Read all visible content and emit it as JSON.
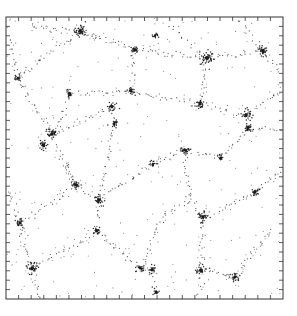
{
  "chart_data": {
    "type": "scatter",
    "title": "",
    "xlabel": "",
    "ylabel": "",
    "description": "Square framed scatter plot of particle positions showing a cellular web: dense clusters at nodes linked by dotted filaments, sparse uniform background points.",
    "grid": false,
    "legend": null,
    "frame": {
      "left": 6,
      "top": 17,
      "right": 283,
      "bottom": 299
    },
    "ticks": {
      "direction": "inward",
      "x_count": 22,
      "y_count": 30,
      "length": 4,
      "labels": []
    },
    "colors": {
      "points": "#1a1a1a",
      "frame": "#333333",
      "background": "#ffffff"
    },
    "clusters": [
      {
        "x": 80,
        "y": 31,
        "r": 5,
        "n": 40
      },
      {
        "x": 155,
        "y": 36,
        "r": 3,
        "n": 14
      },
      {
        "x": 135,
        "y": 50,
        "r": 4,
        "n": 22
      },
      {
        "x": 207,
        "y": 58,
        "r": 6,
        "n": 40
      },
      {
        "x": 263,
        "y": 51,
        "r": 5,
        "n": 32
      },
      {
        "x": 18,
        "y": 78,
        "r": 3,
        "n": 14
      },
      {
        "x": 131,
        "y": 91,
        "r": 4,
        "n": 20
      },
      {
        "x": 200,
        "y": 104,
        "r": 4,
        "n": 28
      },
      {
        "x": 70,
        "y": 94,
        "r": 4,
        "n": 20
      },
      {
        "x": 112,
        "y": 107,
        "r": 4,
        "n": 24
      },
      {
        "x": 246,
        "y": 115,
        "r": 5,
        "n": 28
      },
      {
        "x": 248,
        "y": 128,
        "r": 4,
        "n": 24
      },
      {
        "x": 52,
        "y": 134,
        "r": 5,
        "n": 32
      },
      {
        "x": 43,
        "y": 145,
        "r": 4,
        "n": 28
      },
      {
        "x": 114,
        "y": 124,
        "r": 4,
        "n": 18
      },
      {
        "x": 185,
        "y": 150,
        "r": 4,
        "n": 26
      },
      {
        "x": 221,
        "y": 158,
        "r": 3,
        "n": 14
      },
      {
        "x": 255,
        "y": 192,
        "r": 4,
        "n": 24
      },
      {
        "x": 76,
        "y": 185,
        "r": 4,
        "n": 22
      },
      {
        "x": 99,
        "y": 200,
        "r": 5,
        "n": 26
      },
      {
        "x": 20,
        "y": 223,
        "r": 4,
        "n": 24
      },
      {
        "x": 97,
        "y": 231,
        "r": 4,
        "n": 22
      },
      {
        "x": 153,
        "y": 164,
        "r": 3,
        "n": 12
      },
      {
        "x": 203,
        "y": 217,
        "r": 5,
        "n": 28
      },
      {
        "x": 32,
        "y": 268,
        "r": 5,
        "n": 34
      },
      {
        "x": 140,
        "y": 268,
        "r": 4,
        "n": 20
      },
      {
        "x": 152,
        "y": 270,
        "r": 4,
        "n": 20
      },
      {
        "x": 201,
        "y": 270,
        "r": 5,
        "n": 26
      },
      {
        "x": 235,
        "y": 277,
        "r": 4,
        "n": 22
      },
      {
        "x": 154,
        "y": 7,
        "r": 0,
        "n": 0
      },
      {
        "x": 156,
        "y": 292,
        "r": 3,
        "n": 14
      }
    ],
    "filaments": [
      [
        80,
        31,
        135,
        50
      ],
      [
        135,
        50,
        207,
        58
      ],
      [
        207,
        58,
        263,
        51
      ],
      [
        30,
        28,
        80,
        31
      ],
      [
        80,
        31,
        100,
        35
      ],
      [
        170,
        25,
        207,
        58
      ],
      [
        240,
        22,
        263,
        51
      ],
      [
        10,
        40,
        18,
        78
      ],
      [
        18,
        78,
        40,
        60
      ],
      [
        40,
        60,
        80,
        31
      ],
      [
        18,
        78,
        52,
        134
      ],
      [
        52,
        134,
        70,
        94
      ],
      [
        70,
        94,
        131,
        91
      ],
      [
        131,
        91,
        200,
        104
      ],
      [
        200,
        104,
        246,
        115
      ],
      [
        246,
        115,
        283,
        90
      ],
      [
        135,
        50,
        131,
        91
      ],
      [
        207,
        58,
        200,
        104
      ],
      [
        263,
        51,
        280,
        70
      ],
      [
        112,
        107,
        52,
        134
      ],
      [
        112,
        107,
        114,
        124
      ],
      [
        114,
        124,
        99,
        200
      ],
      [
        52,
        134,
        76,
        185
      ],
      [
        76,
        185,
        99,
        200
      ],
      [
        99,
        200,
        97,
        231
      ],
      [
        99,
        200,
        153,
        164
      ],
      [
        153,
        164,
        185,
        150
      ],
      [
        185,
        150,
        221,
        158
      ],
      [
        221,
        158,
        248,
        128
      ],
      [
        248,
        128,
        283,
        130
      ],
      [
        185,
        150,
        190,
        198
      ],
      [
        190,
        198,
        203,
        217
      ],
      [
        203,
        217,
        255,
        192
      ],
      [
        255,
        192,
        283,
        170
      ],
      [
        203,
        217,
        201,
        270
      ],
      [
        190,
        198,
        165,
        215
      ],
      [
        165,
        215,
        140,
        268
      ],
      [
        97,
        231,
        32,
        268
      ],
      [
        20,
        223,
        32,
        268
      ],
      [
        20,
        223,
        10,
        190
      ],
      [
        32,
        268,
        40,
        299
      ],
      [
        140,
        268,
        152,
        270
      ],
      [
        152,
        270,
        156,
        292
      ],
      [
        201,
        270,
        235,
        277
      ],
      [
        235,
        277,
        255,
        250
      ],
      [
        255,
        250,
        270,
        230
      ],
      [
        97,
        231,
        140,
        268
      ],
      [
        20,
        223,
        76,
        185
      ],
      [
        201,
        270,
        200,
        299
      ],
      [
        76,
        185,
        60,
        160
      ]
    ],
    "background_points": 260,
    "seed": 20240517
  }
}
